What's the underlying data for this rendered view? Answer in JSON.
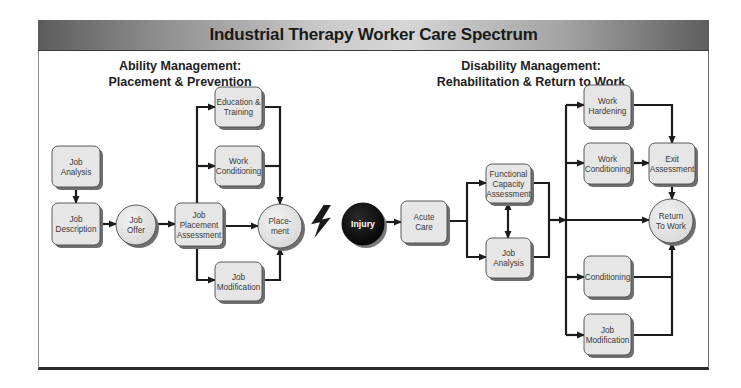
{
  "header": {
    "title": "Industrial Therapy Worker Care Spectrum"
  },
  "sections": {
    "ability": {
      "line1": "Ability Management:",
      "line2": "Placement & Prevention"
    },
    "disability": {
      "line1": "Disability Management:",
      "line2": "Rehabilitation & Return to Work"
    }
  },
  "colors": {
    "box_fill": "#e6e6e6",
    "box_shadow": "#6f6f6f",
    "box_stroke": "#4a4a4a",
    "line": "#1c1c1c",
    "injury_fill": "#111111",
    "text": "#3a3a3a"
  },
  "nodes": [
    {
      "id": "job-analysis-left",
      "shape": "rect",
      "x": 52,
      "y": 146,
      "w": 48,
      "h": 41,
      "lines": [
        "Job",
        "Analysis"
      ]
    },
    {
      "id": "job-description",
      "shape": "rect",
      "x": 52,
      "y": 203,
      "w": 48,
      "h": 42,
      "lines": [
        "Job",
        "Description"
      ]
    },
    {
      "id": "job-offer",
      "shape": "circle",
      "cx": 136,
      "cy": 225,
      "r": 20,
      "lines": [
        "Job",
        "Offer"
      ]
    },
    {
      "id": "job-placement-assessment",
      "shape": "rect",
      "x": 175,
      "y": 203,
      "w": 48,
      "h": 43,
      "lines": [
        "Job",
        "Placement",
        "Assessment"
      ]
    },
    {
      "id": "education-training",
      "shape": "rect",
      "x": 215,
      "y": 87,
      "w": 47,
      "h": 40,
      "lines": [
        "Education &",
        "Training"
      ]
    },
    {
      "id": "work-conditioning-left",
      "shape": "rect",
      "x": 215,
      "y": 146,
      "w": 47,
      "h": 40,
      "lines": [
        "Work",
        "Conditioning"
      ]
    },
    {
      "id": "job-modification-left",
      "shape": "rect",
      "x": 215,
      "y": 262,
      "w": 47,
      "h": 39,
      "lines": [
        "Job",
        "Modification"
      ]
    },
    {
      "id": "placement",
      "shape": "circle",
      "cx": 280,
      "cy": 226,
      "r": 22,
      "lines": [
        "Place-",
        "ment"
      ]
    },
    {
      "id": "injury",
      "shape": "circle-dark",
      "cx": 363,
      "cy": 224,
      "r": 21,
      "lines": [
        "Injury"
      ]
    },
    {
      "id": "acute-care",
      "shape": "rect",
      "x": 401,
      "y": 201,
      "w": 46,
      "h": 42,
      "lines": [
        "Acute",
        "Care"
      ]
    },
    {
      "id": "functional-capacity-assessment",
      "shape": "rect",
      "x": 486,
      "y": 164,
      "w": 45,
      "h": 39,
      "lines": [
        "Functional",
        "Capacity",
        "Assessment"
      ]
    },
    {
      "id": "job-analysis-right",
      "shape": "rect",
      "x": 486,
      "y": 238,
      "w": 45,
      "h": 40,
      "lines": [
        "Job",
        "Analysis"
      ]
    },
    {
      "id": "work-hardening",
      "shape": "rect",
      "x": 584,
      "y": 85,
      "w": 47,
      "h": 42,
      "lines": [
        "Work",
        "Hardening"
      ]
    },
    {
      "id": "work-conditioning-right",
      "shape": "rect",
      "x": 584,
      "y": 143,
      "w": 47,
      "h": 41,
      "lines": [
        "Work",
        "Conditioning"
      ]
    },
    {
      "id": "exit-assessment",
      "shape": "rect",
      "x": 649,
      "y": 143,
      "w": 46,
      "h": 41,
      "lines": [
        "Exit",
        "Assessment"
      ]
    },
    {
      "id": "return-to-work",
      "shape": "circle",
      "cx": 671,
      "cy": 221,
      "r": 22,
      "lines": [
        "Return",
        "To Work"
      ]
    },
    {
      "id": "conditioning",
      "shape": "rect",
      "x": 584,
      "y": 256,
      "w": 47,
      "h": 41,
      "lines": [
        "Conditioning"
      ]
    },
    {
      "id": "job-modification-right",
      "shape": "rect",
      "x": 584,
      "y": 314,
      "w": 47,
      "h": 41,
      "lines": [
        "Job",
        "Modification"
      ]
    }
  ],
  "connectors": [
    {
      "from": "job-analysis-left",
      "to": "job-description",
      "points": [
        [
          76,
          187
        ],
        [
          76,
          203
        ]
      ],
      "arrow": true
    },
    {
      "from": "job-description",
      "to": "job-offer",
      "points": [
        [
          100,
          224
        ],
        [
          116,
          224
        ]
      ],
      "arrow": true
    },
    {
      "from": "job-offer",
      "to": "job-placement-assessment",
      "points": [
        [
          156,
          224
        ],
        [
          175,
          224
        ]
      ],
      "arrow": true
    },
    {
      "from": "job-placement-assessment",
      "to": "education-training",
      "points": [
        [
          197,
          203
        ],
        [
          197,
          107
        ],
        [
          215,
          107
        ]
      ],
      "arrow": true
    },
    {
      "from": "job-placement-assessment",
      "to": "work-conditioning-left",
      "points": [
        [
          197,
          166
        ],
        [
          215,
          166
        ]
      ],
      "arrow": true
    },
    {
      "from": "job-placement-assessment",
      "to": "job-modification-left",
      "points": [
        [
          197,
          246
        ],
        [
          197,
          280
        ],
        [
          215,
          280
        ]
      ],
      "arrow": true
    },
    {
      "from": "job-placement-assessment",
      "to": "placement",
      "points": [
        [
          223,
          226
        ],
        [
          258,
          226
        ]
      ],
      "arrow": true
    },
    {
      "from": "education-training",
      "to": "placement",
      "points": [
        [
          262,
          107
        ],
        [
          280,
          107
        ],
        [
          280,
          204
        ]
      ],
      "arrow": true
    },
    {
      "from": "work-conditioning-left",
      "to": "placement",
      "points": [
        [
          262,
          166
        ],
        [
          280,
          166
        ]
      ],
      "arrow": false
    },
    {
      "from": "job-modification-left",
      "to": "placement",
      "points": [
        [
          262,
          280
        ],
        [
          280,
          280
        ],
        [
          280,
          248
        ]
      ],
      "arrow": true
    },
    {
      "from": "injury",
      "to": "acute-care",
      "points": [
        [
          384,
          222
        ],
        [
          401,
          222
        ]
      ],
      "arrow": true
    },
    {
      "from": "acute-care",
      "to": "functional-capacity-assessment",
      "points": [
        [
          447,
          221
        ],
        [
          467,
          221
        ],
        [
          467,
          183
        ],
        [
          486,
          183
        ]
      ],
      "arrow": true
    },
    {
      "from": "acute-care",
      "to": "job-analysis-right",
      "points": [
        [
          467,
          221
        ],
        [
          467,
          257
        ],
        [
          486,
          257
        ]
      ],
      "arrow": true
    },
    {
      "from": "functional-capacity-assessment",
      "to": "job-analysis-right",
      "points": [
        [
          508,
          203
        ],
        [
          508,
          238
        ]
      ],
      "arrow": true,
      "double": true
    },
    {
      "from": "functional-capacity-assessment",
      "to": "merge",
      "points": [
        [
          531,
          183
        ],
        [
          549,
          183
        ],
        [
          549,
          257
        ],
        [
          531,
          257
        ]
      ],
      "arrow": false
    },
    {
      "from": "merge",
      "to": "trunk",
      "points": [
        [
          549,
          220
        ],
        [
          566,
          220
        ]
      ],
      "arrow": true
    },
    {
      "from": "trunk",
      "to": "trunk",
      "points": [
        [
          566,
          105
        ],
        [
          566,
          335
        ]
      ],
      "arrow": false
    },
    {
      "from": "trunk",
      "to": "work-hardening",
      "points": [
        [
          566,
          105
        ],
        [
          584,
          105
        ]
      ],
      "arrow": true
    },
    {
      "from": "trunk",
      "to": "work-conditioning-right",
      "points": [
        [
          566,
          163
        ],
        [
          584,
          163
        ]
      ],
      "arrow": true
    },
    {
      "from": "trunk",
      "to": "return-to-work",
      "points": [
        [
          566,
          220
        ],
        [
          649,
          220
        ]
      ],
      "arrow": true
    },
    {
      "from": "trunk",
      "to": "conditioning",
      "points": [
        [
          566,
          277
        ],
        [
          584,
          277
        ]
      ],
      "arrow": true
    },
    {
      "from": "trunk",
      "to": "job-modification-right",
      "points": [
        [
          566,
          335
        ],
        [
          584,
          335
        ]
      ],
      "arrow": true
    },
    {
      "from": "work-hardening",
      "to": "exit-assessment",
      "points": [
        [
          631,
          105
        ],
        [
          672,
          105
        ],
        [
          672,
          143
        ]
      ],
      "arrow": true
    },
    {
      "from": "work-conditioning-right",
      "to": "exit-assessment",
      "points": [
        [
          631,
          163
        ],
        [
          649,
          163
        ]
      ],
      "arrow": true
    },
    {
      "from": "exit-assessment",
      "to": "return-to-work",
      "points": [
        [
          672,
          184
        ],
        [
          672,
          199
        ]
      ],
      "arrow": true
    },
    {
      "from": "conditioning",
      "to": "return-to-work",
      "points": [
        [
          631,
          277
        ],
        [
          672,
          277
        ],
        [
          672,
          243
        ]
      ],
      "arrow": true
    },
    {
      "from": "job-modification-right",
      "to": "return-to-work",
      "points": [
        [
          631,
          335
        ],
        [
          672,
          335
        ],
        [
          672,
          277
        ]
      ],
      "arrow": false
    }
  ],
  "lightning": {
    "x": 310,
    "y": 205,
    "w": 22,
    "h": 33
  }
}
